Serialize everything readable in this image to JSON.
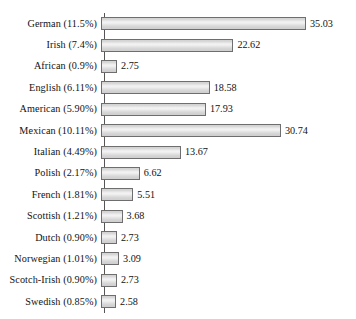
{
  "chart_data": {
    "type": "bar",
    "orientation": "horizontal",
    "title": "",
    "xlabel": "",
    "ylabel": "",
    "grid": false,
    "legend": null,
    "axis_line": "left",
    "xlim": [
      0,
      35.03
    ],
    "value_labels_shown": true,
    "categories": [
      "German (11.5%)",
      "Irish (7.4%)",
      "African (0.9%)",
      "English (6.11%)",
      "American (5.90%)",
      "Mexican (10.11%)",
      "Italian (4.49%)",
      "Polish (2.17%)",
      "French (1.81%)",
      "Scottish (1.21%)",
      "Dutch (0.90%)",
      "Norwegian (1.01%)",
      "Scotch-Irish (0.90%)",
      "Swedish (0.85%)"
    ],
    "values": [
      35.03,
      22.62,
      2.75,
      18.58,
      17.93,
      30.74,
      13.67,
      6.62,
      5.51,
      3.68,
      2.73,
      3.09,
      2.73,
      2.58
    ],
    "value_text": [
      "35.03",
      "22.62",
      "2.75",
      "18.58",
      "17.93",
      "30.74",
      "13.67",
      "6.62",
      "5.51",
      "3.68",
      "2.73",
      "3.09",
      "2.73",
      "2.58"
    ],
    "group_names": [
      "German",
      "Irish",
      "African",
      "English",
      "American",
      "Mexican",
      "Italian",
      "Polish",
      "French",
      "Scottish",
      "Dutch",
      "Norwegian",
      "Scotch-Irish",
      "Swedish"
    ],
    "group_percents": [
      "11.5%",
      "7.4%",
      "0.9%",
      "6.11%",
      "5.90%",
      "10.11%",
      "4.49%",
      "2.17%",
      "1.81%",
      "1.21%",
      "0.90%",
      "1.01%",
      "0.90%",
      "0.85%"
    ]
  },
  "style": {
    "bar_fill": "#e0e0e0",
    "bar_border": "#6e6e6e",
    "axis_color": "#555555",
    "text_color": "#121212",
    "background": "#ffffff"
  }
}
